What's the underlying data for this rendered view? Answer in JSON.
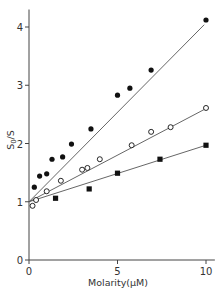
{
  "chart_data": {
    "type": "scatter",
    "title": "",
    "xlabel": "Molarity(μM)",
    "ylabel": "S0/S",
    "ylabel_main": "S",
    "ylabel_sub": "0",
    "ylabel_tail": "/S",
    "xlim": [
      0,
      10.5
    ],
    "ylim": [
      0,
      4.3
    ],
    "x_ticks": [
      0,
      5,
      10
    ],
    "x_tick_labels": [
      "0",
      "5",
      "10"
    ],
    "y_ticks": [
      0,
      1,
      2,
      3,
      4
    ],
    "y_tick_labels": [
      "0",
      "1",
      "2",
      "3",
      "4"
    ],
    "grid": false,
    "legend": null,
    "series": [
      {
        "name": "filled circles",
        "marker": "filled-circle",
        "color": "#111111",
        "points": [
          [
            0.3,
            1.25
          ],
          [
            0.6,
            1.44
          ],
          [
            1.0,
            1.48
          ],
          [
            1.3,
            1.73
          ],
          [
            1.9,
            1.77
          ],
          [
            2.4,
            1.99
          ],
          [
            3.5,
            2.25
          ],
          [
            5.0,
            2.83
          ],
          [
            5.7,
            2.95
          ],
          [
            6.9,
            3.26
          ],
          [
            10.0,
            4.12
          ]
        ],
        "fit_line": {
          "intercept": 1.0,
          "slope": 0.307,
          "x_end": 9.9
        }
      },
      {
        "name": "open circles",
        "marker": "open-circle",
        "color": "#111111",
        "points": [
          [
            0.2,
            0.93
          ],
          [
            0.4,
            1.03
          ],
          [
            1.0,
            1.18
          ],
          [
            1.8,
            1.36
          ],
          [
            3.0,
            1.55
          ],
          [
            3.3,
            1.58
          ],
          [
            4.0,
            1.73
          ],
          [
            5.8,
            1.97
          ],
          [
            6.9,
            2.2
          ],
          [
            8.0,
            2.28
          ],
          [
            10.0,
            2.61
          ]
        ],
        "fit_line": {
          "intercept": 1.0,
          "slope": 0.16,
          "x_end": 10.0
        }
      },
      {
        "name": "filled squares",
        "marker": "filled-square",
        "color": "#111111",
        "points": [
          [
            1.5,
            1.06
          ],
          [
            3.4,
            1.22
          ],
          [
            5.0,
            1.49
          ],
          [
            7.4,
            1.73
          ],
          [
            10.0,
            1.97
          ]
        ],
        "fit_line": {
          "intercept": 1.0,
          "slope": 0.097,
          "x_end": 10.0
        }
      }
    ]
  },
  "layout": {
    "x0_px": 29,
    "x10_px": 206,
    "y0_px": 260,
    "y4_px": 27,
    "axis_color": "#444444",
    "line_color": "#555555"
  }
}
